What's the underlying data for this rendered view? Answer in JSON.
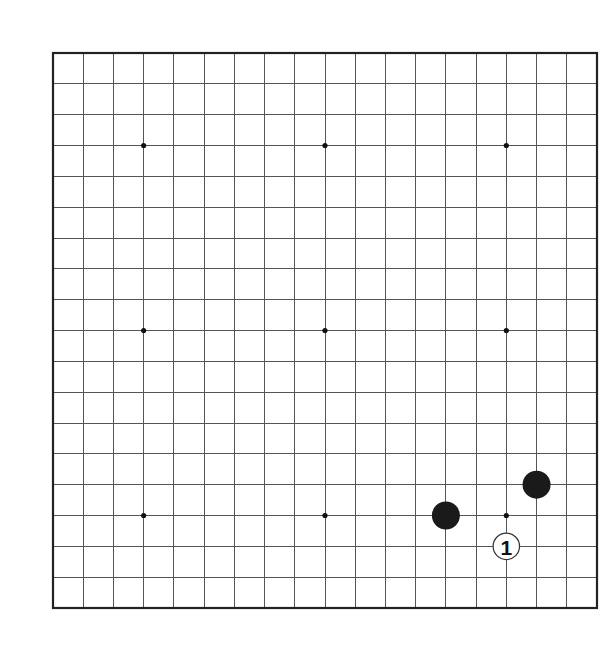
{
  "board": {
    "size": 19,
    "origin_px": {
      "x": 53,
      "y": 53
    },
    "end_px": {
      "x": 597,
      "y": 608
    },
    "line_color": "#555555",
    "border_color": "#222222",
    "background": "#ffffff",
    "star_points": [
      {
        "col": 3,
        "row": 3
      },
      {
        "col": 9,
        "row": 3
      },
      {
        "col": 15,
        "row": 3
      },
      {
        "col": 3,
        "row": 9
      },
      {
        "col": 9,
        "row": 9
      },
      {
        "col": 15,
        "row": 9
      },
      {
        "col": 3,
        "row": 15
      },
      {
        "col": 9,
        "row": 15
      },
      {
        "col": 15,
        "row": 15
      }
    ]
  },
  "stones": [
    {
      "color": "black",
      "col": 13,
      "row": 15,
      "label": ""
    },
    {
      "color": "black",
      "col": 16,
      "row": 14,
      "label": ""
    },
    {
      "color": "white",
      "col": 15,
      "row": 16,
      "label": "1"
    }
  ],
  "colors": {
    "black_stone": "#1a1a1a",
    "white_stone": "#ffffff",
    "white_outline": "#333333",
    "label_text": "#111111"
  }
}
